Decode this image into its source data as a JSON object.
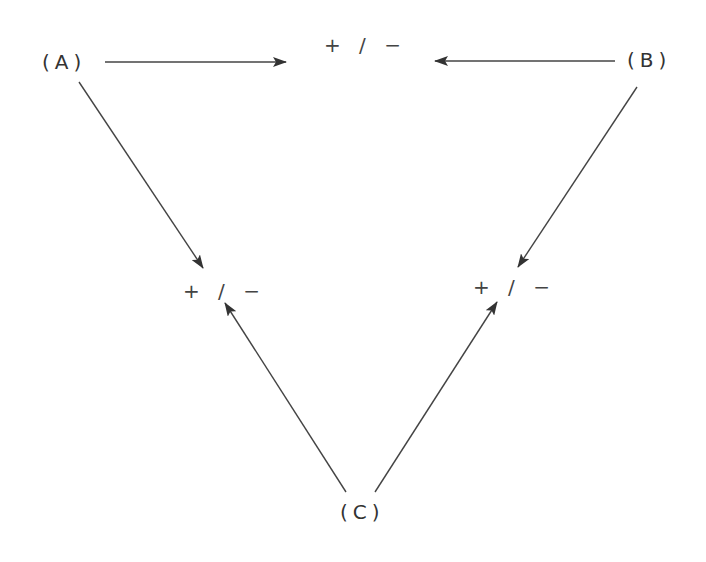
{
  "diagram": {
    "type": "causal-triangle",
    "nodes": {
      "a": {
        "label": "(A)"
      },
      "b": {
        "label": "(B)"
      },
      "c": {
        "label": "(C)"
      }
    },
    "effects": {
      "top": {
        "label": "+ / −"
      },
      "left": {
        "label": "+ / −"
      },
      "right": {
        "label": "+ / −"
      }
    },
    "edges": [
      {
        "from": "A",
        "to": "top effect",
        "direction": "right"
      },
      {
        "from": "B",
        "to": "top effect",
        "direction": "left"
      },
      {
        "from": "A",
        "to": "left effect",
        "direction": "down-right"
      },
      {
        "from": "B",
        "to": "right effect",
        "direction": "down-left"
      },
      {
        "from": "C",
        "to": "left effect",
        "direction": "up-left"
      },
      {
        "from": "C",
        "to": "right effect",
        "direction": "up-right"
      }
    ],
    "colors": {
      "line": "#444444",
      "text": "#333333",
      "background": "#ffffff"
    }
  }
}
